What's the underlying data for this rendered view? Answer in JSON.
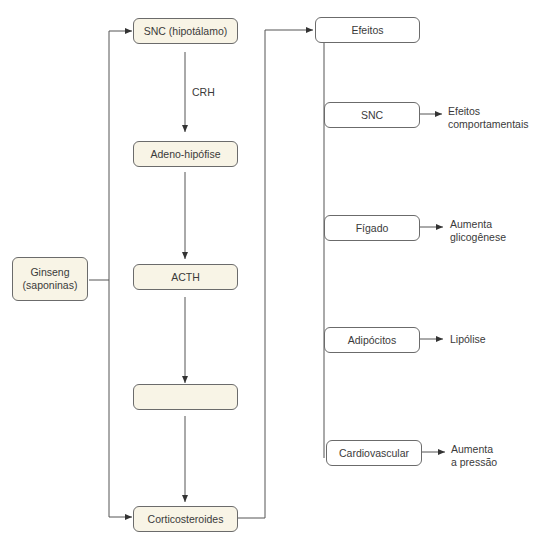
{
  "diagram": {
    "source": {
      "label_line1": "Ginseng",
      "label_line2": "(saponinas)"
    },
    "axis_nodes": {
      "hypothalamus": "SNC (hipotálamo)",
      "crh_label": "CRH",
      "pituitary": "Adeno-hipófise",
      "acth": "ACTH",
      "adrenals": "Adrenais",
      "corticosteroids": "Corticosteroides"
    },
    "effects": {
      "header": "Efeitos",
      "targets": [
        {
          "organ": "SNC",
          "outcome_line1": "Efeitos",
          "outcome_line2": "comportamentais"
        },
        {
          "organ": "Fígado",
          "outcome_line1": "Aumenta",
          "outcome_line2": "glicogênese"
        },
        {
          "organ": "Adipócitos",
          "outcome_line1": "Lipólise",
          "outcome_line2": ""
        },
        {
          "organ": "Cardiovascular",
          "outcome_line1": "Aumenta",
          "outcome_line2": "a pressão"
        }
      ]
    },
    "colors": {
      "node_fill": "#f8f4e6",
      "line": "#555555"
    }
  }
}
